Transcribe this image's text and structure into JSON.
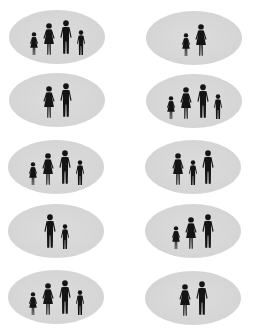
{
  "colors": {
    "background": "#ffffff",
    "oval_fill": "#d6d6d6",
    "silhouette": "#141414"
  },
  "figure_sizes": {
    "man": {
      "w": 14,
      "h": 36
    },
    "woman": {
      "w": 14,
      "h": 33
    },
    "boy": {
      "w": 10,
      "h": 26
    },
    "girl": {
      "w": 10,
      "h": 24
    }
  },
  "ovals": [
    {
      "id": 1,
      "row": 1,
      "col": "left",
      "cx": 57,
      "cy": 37,
      "members": [
        "girl",
        "woman",
        "man",
        "boy"
      ]
    },
    {
      "id": 2,
      "row": 1,
      "col": "right",
      "cx": 194,
      "cy": 38,
      "members": [
        "girl",
        "woman"
      ]
    },
    {
      "id": 3,
      "row": 2,
      "col": "left",
      "cx": 57,
      "cy": 100,
      "members": [
        "woman",
        "man"
      ]
    },
    {
      "id": 4,
      "row": 2,
      "col": "right",
      "cx": 194,
      "cy": 101,
      "members": [
        "girl",
        "woman",
        "man",
        "boy"
      ]
    },
    {
      "id": 5,
      "row": 3,
      "col": "left",
      "cx": 56,
      "cy": 167,
      "members": [
        "girl",
        "woman",
        "man",
        "boy"
      ]
    },
    {
      "id": 6,
      "row": 3,
      "col": "right",
      "cx": 193,
      "cy": 167,
      "members": [
        "woman",
        "boy",
        "man"
      ]
    },
    {
      "id": 7,
      "row": 4,
      "col": "left",
      "cx": 56,
      "cy": 231,
      "members": [
        "man",
        "boy"
      ]
    },
    {
      "id": 8,
      "row": 4,
      "col": "right",
      "cx": 193,
      "cy": 231,
      "members": [
        "girl",
        "woman",
        "man"
      ]
    },
    {
      "id": 9,
      "row": 5,
      "col": "left",
      "cx": 56,
      "cy": 297,
      "members": [
        "girl",
        "woman",
        "man",
        "boy"
      ]
    },
    {
      "id": 10,
      "row": 5,
      "col": "right",
      "cx": 193,
      "cy": 298,
      "members": [
        "woman",
        "man"
      ]
    }
  ]
}
